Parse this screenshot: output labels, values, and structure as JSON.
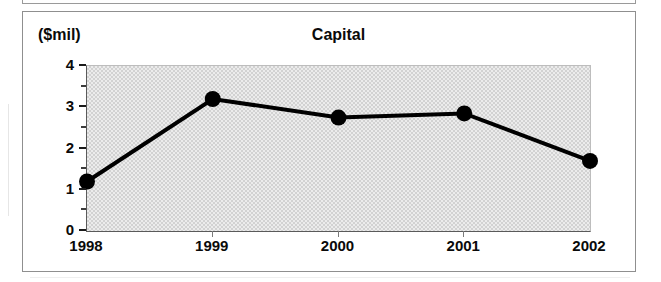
{
  "figure": {
    "y_axis_unit_label": "($mil)",
    "title": "Capital"
  },
  "chart_data": {
    "type": "line",
    "title": "Capital",
    "xlabel": "",
    "ylabel": "($mil)",
    "categories": [
      "1998",
      "1999",
      "2000",
      "2001",
      "2002"
    ],
    "values": [
      1.2,
      3.2,
      2.75,
      2.85,
      1.7
    ],
    "series": [
      {
        "name": "Capital",
        "values": [
          1.2,
          3.2,
          2.75,
          2.85,
          1.7
        ]
      }
    ],
    "ylim": [
      0,
      4
    ],
    "y_major_ticks": [
      "0",
      "1",
      "2",
      "3",
      "4"
    ],
    "y_minor_tick_values": [
      0.5,
      1.5,
      2.5,
      3.5
    ],
    "grid": false,
    "legend": "none",
    "marker": "filled-circle",
    "line_color": "#000000",
    "marker_color": "#000000",
    "plot_background": "#e2e2e2"
  },
  "axes": {
    "y_ticks": [
      {
        "label": "4",
        "value": 4
      },
      {
        "label": "3",
        "value": 3
      },
      {
        "label": "2",
        "value": 2
      },
      {
        "label": "1",
        "value": 1
      },
      {
        "label": "0",
        "value": 0
      }
    ],
    "x_ticks": [
      {
        "label": "1998"
      },
      {
        "label": "1999"
      },
      {
        "label": "2000"
      },
      {
        "label": "2001"
      },
      {
        "label": "2002"
      }
    ]
  }
}
